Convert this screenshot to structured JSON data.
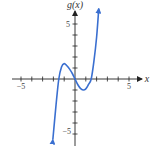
{
  "chart_data": {
    "type": "line",
    "title": "",
    "xlabel": "x",
    "ylabel": "g(x)",
    "xlim": [
      -5.5,
      6
    ],
    "ylim": [
      -6,
      6.5
    ],
    "x_tick_labels": [
      "-5",
      "5"
    ],
    "y_tick_labels": [
      "5",
      "-5"
    ],
    "x_ticks": [
      -5,
      -4,
      -3,
      -2,
      -1,
      1,
      2,
      3,
      4,
      5
    ],
    "y_ticks": [
      -5,
      -4,
      -3,
      -2,
      -1,
      1,
      2,
      3,
      4,
      5
    ],
    "grid": false,
    "series": [
      {
        "name": "g(x)",
        "color": "#3a6fd0",
        "x": [
          -2.05,
          -1.75,
          -1.5,
          -1.25,
          -1.0,
          -0.75,
          -0.5,
          -0.25,
          0,
          0.25,
          0.5,
          0.75,
          1.0,
          1.25,
          1.5,
          1.75,
          2.0,
          2.2
        ],
        "values": [
          -5.5,
          -2.3,
          0.0,
          1.1,
          1.4,
          1.2,
          0.9,
          0.5,
          0.0,
          -0.5,
          -0.85,
          -1.0,
          -0.9,
          -0.5,
          0.0,
          1.6,
          3.8,
          6.4
        ]
      }
    ],
    "annotations": [
      "arrowheads on both curve ends",
      "arrowheads on positive axes"
    ]
  },
  "labels": {
    "y_axis": "g(x)",
    "x_axis": "x",
    "x_min_tick": "−5",
    "x_max_tick": "5",
    "y_max_tick": "5",
    "y_min_tick": "−5"
  }
}
